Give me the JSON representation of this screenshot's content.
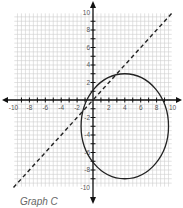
{
  "caption": "Graph C",
  "chart_data": {
    "type": "line",
    "title": "",
    "xlabel": "",
    "ylabel": "",
    "xlim": [
      -10,
      10
    ],
    "ylim": [
      -10,
      10
    ],
    "grid": true,
    "x_ticks_labeled": [
      -10,
      -8,
      -6,
      -4,
      -2,
      2,
      4,
      6,
      8,
      10
    ],
    "y_ticks_labeled": [
      10,
      8,
      6,
      4,
      2,
      -2,
      -4,
      -6,
      -8,
      -10
    ],
    "series": [
      {
        "name": "dashed line",
        "style": "dashed",
        "equation": "y = x",
        "points": [
          [
            -10,
            -10
          ],
          [
            10,
            10
          ]
        ]
      },
      {
        "name": "ellipse",
        "style": "solid",
        "center": [
          4,
          -3
        ],
        "rx": 5.5,
        "ry": 6
      }
    ]
  }
}
